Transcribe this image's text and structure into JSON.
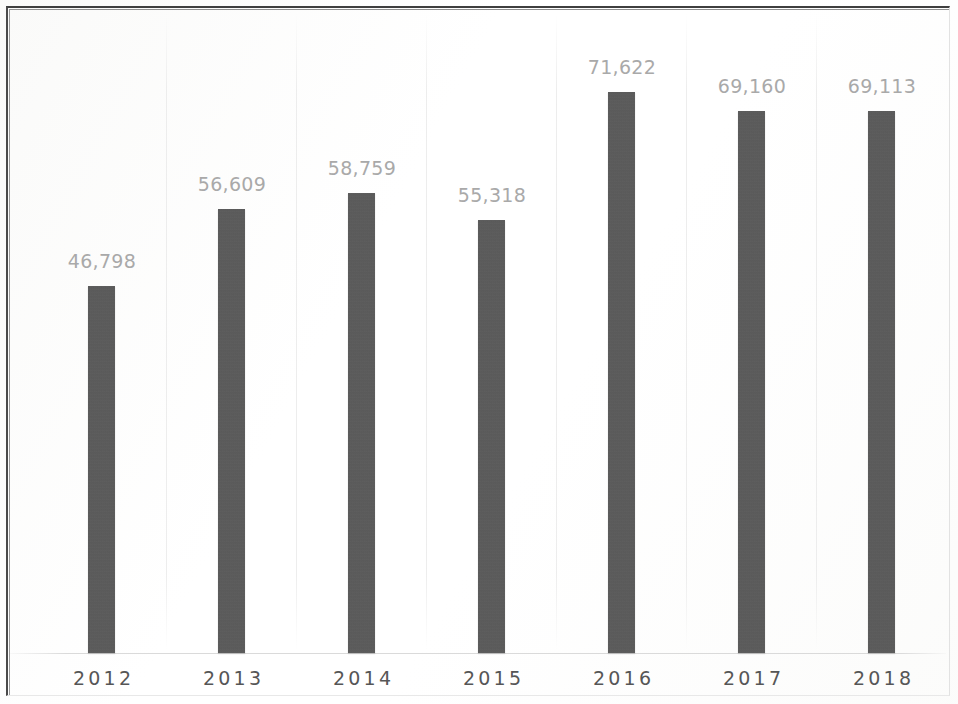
{
  "chart_data": {
    "type": "bar",
    "title": "",
    "subtitle": "",
    "xlabel": "",
    "ylabel": "",
    "categories": [
      "2012",
      "2013",
      "2014",
      "2015",
      "2016",
      "2017",
      "2018"
    ],
    "values": [
      46798,
      56609,
      58759,
      55318,
      71622,
      69160,
      69113
    ],
    "value_labels": [
      "46,798",
      "56,609",
      "58,759",
      "55,318",
      "71,622",
      "69,160",
      "69,113"
    ],
    "series": [
      {
        "name": "",
        "values": [
          46798,
          56609,
          58759,
          55318,
          71622,
          69160,
          69113
        ]
      }
    ],
    "ylim": [
      0,
      71622
    ],
    "grid": false,
    "legend": false,
    "legend_position": "none",
    "data_labels": true,
    "bar_color": "#585858",
    "value_label_color": "#a9a9a9",
    "category_label_color": "#565656",
    "background_color": "#ffffff",
    "frame_color": "#4a4a4a"
  },
  "bars": [
    {
      "label": "2012",
      "value_label": "46,798",
      "value": 46798
    },
    {
      "label": "2013",
      "value_label": "56,609",
      "value": 56609
    },
    {
      "label": "2014",
      "value_label": "58,759",
      "value": 58759
    },
    {
      "label": "2015",
      "value_label": "55,318",
      "value": 55318
    },
    {
      "label": "2016",
      "value_label": "71,622",
      "value": 71622
    },
    {
      "label": "2017",
      "value_label": "69,160",
      "value": 69160
    },
    {
      "label": "2018",
      "value_label": "69,113",
      "value": 69113
    }
  ]
}
